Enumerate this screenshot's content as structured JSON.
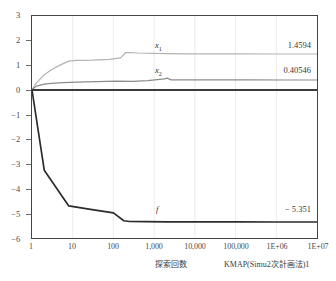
{
  "chart_data": {
    "type": "line",
    "title": "",
    "xlabel": "探索回数",
    "ylabel": "",
    "xscale": "log",
    "yscale": "linear",
    "xlim": [
      1,
      10000000
    ],
    "ylim": [
      -6,
      3
    ],
    "grid": true,
    "legend_position": "inline-right",
    "x_tick_labels": [
      "1",
      "10",
      "100",
      "1,000",
      "10,000",
      "100,000",
      "1E+06",
      "1E+07"
    ],
    "x_tick_values": [
      1,
      10,
      100,
      1000,
      10000,
      100000,
      1000000,
      10000000
    ],
    "y_tick_labels": [
      "3",
      "2",
      "1",
      "0",
      "−1",
      "−2",
      "−3",
      "−4",
      "−5",
      "−6"
    ],
    "y_tick_values": [
      3,
      2,
      1,
      0,
      -1,
      -2,
      -3,
      -4,
      -5,
      -6
    ],
    "series": [
      {
        "name": "x1",
        "key_label": "x",
        "key_sub": "1",
        "color": "#b4b4b4",
        "final_value": "1.4594",
        "x": [
          1,
          1.3,
          2,
          3,
          5,
          8,
          12,
          30,
          80,
          150,
          200,
          260,
          400,
          900,
          2000,
          6000,
          20000,
          100000,
          1000000,
          10000000
        ],
        "y": [
          0.02,
          0.3,
          0.62,
          0.82,
          1.02,
          1.17,
          1.2,
          1.21,
          1.24,
          1.3,
          1.52,
          1.52,
          1.5,
          1.48,
          1.47,
          1.465,
          1.462,
          1.46,
          1.4594,
          1.4594
        ]
      },
      {
        "name": "x2",
        "key_label": "x",
        "key_sub": "2",
        "color": "#8c8c8c",
        "final_value": "0.40546",
        "x": [
          1,
          1.3,
          2,
          3,
          6,
          12,
          40,
          120,
          300,
          700,
          1200,
          1800,
          2100,
          2600,
          5000,
          20000,
          200000,
          2000000,
          10000000
        ],
        "y": [
          0.02,
          0.16,
          0.24,
          0.27,
          0.3,
          0.32,
          0.34,
          0.36,
          0.35,
          0.38,
          0.42,
          0.45,
          0.48,
          0.41,
          0.41,
          0.408,
          0.406,
          0.40546,
          0.40546
        ]
      },
      {
        "name": "f",
        "key_label": "f",
        "key_sub": "",
        "color": "#2b2b2b",
        "final_value": "− 5.351",
        "x": [
          1,
          2,
          8,
          30,
          100,
          180,
          250,
          600,
          2000,
          10000,
          100000,
          1000000,
          10000000
        ],
        "y": [
          0.0,
          -3.25,
          -4.7,
          -4.85,
          -4.98,
          -5.3,
          -5.33,
          -5.34,
          -5.345,
          -5.348,
          -5.35,
          -5.351,
          -5.351
        ]
      }
    ],
    "annotations": [
      {
        "name": "x1-key",
        "text": "x",
        "sub": "1"
      },
      {
        "name": "x2-key",
        "text": "x",
        "sub": "2"
      },
      {
        "name": "f-key",
        "text": "f",
        "sub": ""
      }
    ]
  },
  "caption": {
    "xlabel": "探索回数",
    "title": "KMAP(Simu2次計画法)1"
  },
  "colors": {
    "x1": "#b4b4b4",
    "x2": "#8c8c8c",
    "f": "#2b2b2b",
    "axis": "#444444",
    "grid": "#e2e2e2",
    "zero_line": "#3a3a3a"
  }
}
